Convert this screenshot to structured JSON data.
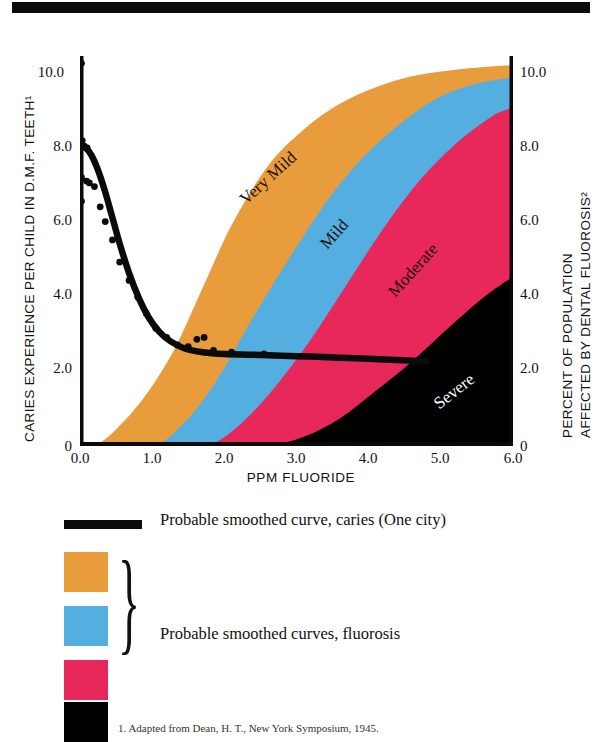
{
  "chart_data": {
    "type": "area",
    "title": "",
    "xlabel": "PPM FLUORIDE",
    "ylabel_left": "CARIES EXPERIENCE PER CHILD IN D.M.F. TEETH¹",
    "ylabel_right_line1": "PERCENT OF POPULATION",
    "ylabel_right_line2": "AFFECTED BY DENTAL FLUOROSIS²",
    "xlim": [
      0.0,
      6.0
    ],
    "ylim": [
      0.0,
      10.6
    ],
    "xticks": [
      "0.0",
      "1.0",
      "2.0",
      "3.0",
      "4.0",
      "5.0",
      "6.0"
    ],
    "xtick_values": [
      0.0,
      1.0,
      2.0,
      3.0,
      4.0,
      5.0,
      6.0
    ],
    "yticks_left": [
      "0",
      "2.0",
      "4.0",
      "6.0",
      "8.0",
      "10.0"
    ],
    "yticks_right": [
      "0",
      "2.0",
      "4.0",
      "6.0",
      "8.0",
      "10.0"
    ],
    "ytick_values": [
      0,
      2,
      4,
      6,
      8,
      10
    ],
    "grid": false,
    "legend_position": "below",
    "series": [
      {
        "name": "Very Mild",
        "kind": "stacked-area-top",
        "color": "#E89C3C",
        "label_in_plot": "Very Mild",
        "x": [
          0.0,
          0.2,
          0.5,
          0.9,
          1.3,
          1.7,
          2.1,
          2.6,
          3.1,
          3.6,
          4.1,
          4.6,
          5.1,
          5.6,
          6.0
        ],
        "y": [
          0.0,
          0.0,
          0.45,
          1.35,
          2.6,
          4.3,
          6.0,
          7.6,
          8.6,
          9.3,
          9.75,
          10.05,
          10.2,
          10.3,
          10.35
        ]
      },
      {
        "name": "Mild",
        "kind": "stacked-area-top",
        "color": "#55AEE0",
        "label_in_plot": "Mild",
        "x": [
          0.0,
          0.6,
          1.05,
          1.5,
          1.9,
          2.4,
          2.9,
          3.4,
          3.9,
          4.4,
          4.9,
          5.4,
          6.0
        ],
        "y": [
          0.0,
          0.0,
          0.0,
          0.75,
          1.8,
          3.5,
          5.1,
          6.6,
          7.8,
          8.7,
          9.4,
          9.8,
          10.02
        ]
      },
      {
        "name": "Moderate",
        "kind": "stacked-area-top",
        "color": "#E8275A",
        "label_in_plot": "Moderate",
        "x": [
          0.0,
          1.2,
          1.75,
          2.2,
          2.7,
          3.2,
          3.7,
          4.2,
          4.7,
          5.2,
          5.7,
          6.0
        ],
        "y": [
          0.0,
          0.0,
          0.0,
          0.55,
          1.6,
          2.9,
          4.4,
          5.9,
          7.2,
          8.2,
          8.95,
          9.2
        ]
      },
      {
        "name": "Severe",
        "kind": "stacked-area-top",
        "color": "#000000",
        "label_in_plot": "Severe",
        "x": [
          0.0,
          2.0,
          2.6,
          3.1,
          3.6,
          4.1,
          4.6,
          5.1,
          5.6,
          6.0
        ],
        "y": [
          0.0,
          0.0,
          0.0,
          0.25,
          0.75,
          1.5,
          2.3,
          3.2,
          4.05,
          4.6
        ]
      },
      {
        "name": "Probable smoothed curve, caries (One city)",
        "kind": "line",
        "color": "#0b0b0b",
        "x": [
          0.0,
          0.08,
          0.16,
          0.25,
          0.35,
          0.45,
          0.55,
          0.68,
          0.82,
          0.95,
          1.1,
          1.25,
          1.45,
          1.7,
          2.0,
          2.4,
          2.8,
          3.2,
          3.6,
          4.0,
          4.4,
          4.8
        ],
        "y": [
          8.15,
          8.1,
          7.9,
          7.5,
          6.9,
          6.2,
          5.5,
          4.7,
          4.0,
          3.5,
          3.1,
          2.85,
          2.65,
          2.55,
          2.5,
          2.48,
          2.45,
          2.43,
          2.4,
          2.37,
          2.34,
          2.3
        ]
      }
    ],
    "scatter": {
      "name": "caries observations",
      "color": "#0b0b0b",
      "points": [
        [
          0.02,
          10.4
        ],
        [
          0.03,
          8.3
        ],
        [
          0.06,
          8.15
        ],
        [
          0.1,
          8.1
        ],
        [
          0.02,
          7.3
        ],
        [
          0.09,
          7.2
        ],
        [
          0.13,
          7.15
        ],
        [
          0.02,
          6.65
        ],
        [
          0.2,
          7.05
        ],
        [
          0.28,
          6.5
        ],
        [
          0.35,
          6.1
        ],
        [
          0.45,
          5.6
        ],
        [
          0.55,
          5.0
        ],
        [
          0.68,
          4.5
        ],
        [
          0.8,
          4.05
        ],
        [
          0.92,
          3.6
        ],
        [
          1.05,
          3.2
        ],
        [
          1.2,
          2.95
        ],
        [
          1.35,
          2.75
        ],
        [
          1.5,
          2.7
        ],
        [
          1.62,
          2.9
        ],
        [
          1.72,
          2.95
        ],
        [
          1.85,
          2.6
        ],
        [
          2.1,
          2.55
        ],
        [
          2.55,
          2.5
        ]
      ]
    }
  },
  "legend": {
    "line_entry": "Probable smoothed curve, caries (One city)",
    "swatch_entry": "Probable smoothed curves, fluorosis",
    "swatches": [
      {
        "name": "Very Mild",
        "color": "#E89C3C"
      },
      {
        "name": "Mild",
        "color": "#55AEE0"
      },
      {
        "name": "Moderate",
        "color": "#E8275A"
      },
      {
        "name": "Severe",
        "color": "#000000"
      }
    ],
    "brace": "}"
  },
  "footnote": "1. Adapted from Dean, H. T., New York Symposium, 1945."
}
